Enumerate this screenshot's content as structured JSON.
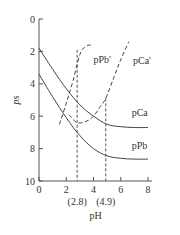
{
  "chart_data": {
    "type": "line",
    "title": "",
    "xlabel": "pH",
    "ylabel": "ps",
    "xlim": [
      0,
      8
    ],
    "ylim": [
      10,
      0
    ],
    "y_inverted": true,
    "grid": false,
    "x_ticks": [
      0,
      2,
      4,
      6,
      8
    ],
    "x_tick_labels": [
      "0",
      "2",
      "4",
      "6",
      "8"
    ],
    "y_ticks": [
      0,
      2,
      4,
      6,
      8,
      10
    ],
    "y_tick_labels": [
      "0",
      "2",
      "4",
      "6",
      "8",
      "10"
    ],
    "series": [
      {
        "name": "pCa",
        "style": "solid",
        "x": [
          0,
          1,
          2,
          3,
          4,
          5,
          6,
          7,
          8
        ],
        "y": [
          1.8,
          3.1,
          4.3,
          5.3,
          6.0,
          6.5,
          6.65,
          6.7,
          6.7
        ]
      },
      {
        "name": "pPb",
        "style": "solid",
        "x": [
          0,
          1,
          2,
          3,
          4,
          5,
          6,
          7,
          8
        ],
        "y": [
          3.4,
          4.8,
          6.1,
          7.2,
          8.0,
          8.45,
          8.6,
          8.65,
          8.65
        ]
      },
      {
        "name": "pPb'",
        "style": "dashed",
        "x": [
          1.5,
          2.0,
          2.5,
          3.0,
          3.4,
          3.8
        ],
        "y": [
          6.5,
          5.2,
          3.8,
          2.2,
          1.7,
          1.6
        ]
      },
      {
        "name": "pCa'",
        "style": "dashed",
        "x": [
          2.2,
          2.8,
          3.5,
          4.0,
          4.5,
          4.9,
          5.5,
          6.0,
          6.6
        ],
        "y": [
          5.9,
          6.4,
          6.3,
          6.0,
          5.4,
          4.9,
          3.6,
          2.5,
          1.4
        ]
      }
    ],
    "annotations": [
      {
        "type": "vline",
        "x": 2.8,
        "label": "(2.8)"
      },
      {
        "type": "vline",
        "x": 4.9,
        "label": "(4.9)"
      }
    ],
    "labels": {
      "pCa": "pCa",
      "pPb": "pPb",
      "pPb_prime": "pPb'",
      "pCa_prime": "pCa'"
    }
  }
}
